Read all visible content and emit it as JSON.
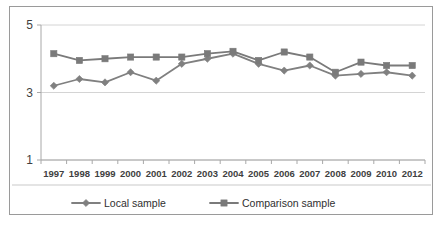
{
  "chart_data": {
    "type": "line",
    "title": "",
    "subtitle": "",
    "xlabel": "",
    "ylabel": "",
    "categories": [
      "1997",
      "1998",
      "1999",
      "2000",
      "2001",
      "2002",
      "2003",
      "2004",
      "2005",
      "2006",
      "2007",
      "2008",
      "2009",
      "2010",
      "2012"
    ],
    "x_tick_labels": [
      "1997",
      "1998",
      "1999",
      "2000",
      "2001",
      "2002",
      "2003",
      "2004",
      "2005",
      "2006",
      "2007",
      "2008",
      "2009",
      "2010",
      "2012"
    ],
    "y_tick_labels": [
      "1",
      "3",
      "5"
    ],
    "y_ticks": [
      1,
      3,
      5
    ],
    "ylim": [
      1,
      5
    ],
    "grid": "horizontal",
    "legend_position": "bottom",
    "series": [
      {
        "name": "Local sample",
        "marker": "diamond",
        "color": "#808080",
        "values": [
          3.2,
          3.4,
          3.3,
          3.6,
          3.35,
          3.85,
          4.0,
          4.15,
          3.85,
          3.65,
          3.8,
          3.5,
          3.55,
          3.6,
          3.5
        ]
      },
      {
        "name": "Comparison sample",
        "marker": "square",
        "color": "#7a7a7a",
        "values": [
          4.15,
          3.95,
          4.0,
          4.05,
          4.05,
          4.05,
          4.15,
          4.22,
          3.95,
          4.2,
          4.05,
          3.6,
          3.9,
          3.8,
          3.8
        ]
      }
    ]
  },
  "legend": {
    "items": [
      {
        "label": "Local sample",
        "marker": "diamond"
      },
      {
        "label": "Comparison sample",
        "marker": "square"
      }
    ]
  },
  "colors": {
    "series_local": "#808080",
    "series_comparison": "#7a7a7a",
    "gridline": "#d4d4d4",
    "axis": "#a8a8a8",
    "border": "#9a9a9a",
    "text": "#3f3f3f",
    "background": "#ffffff"
  }
}
